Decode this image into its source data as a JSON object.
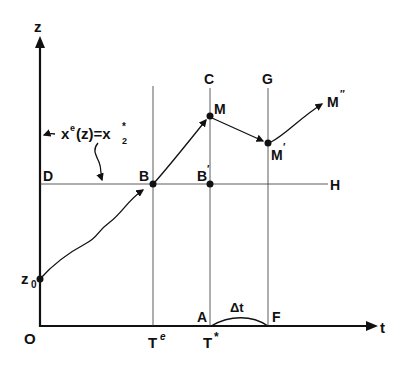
{
  "diagram": {
    "axes": {
      "y_label": "z",
      "x_label": "t",
      "origin_label": "O"
    },
    "points": {
      "C": "C",
      "G": "G",
      "M": "M",
      "M_prime": "M",
      "M_prime_mark": "′",
      "M_dprime": "M",
      "M_dprime_mark": "″",
      "D": "D",
      "B": "B",
      "B_prime": "B",
      "B_prime_mark": "′",
      "H": "H",
      "A": "A",
      "F": "F",
      "z0": "z",
      "z0_sub": "0"
    },
    "ticks": {
      "Te": "T",
      "Te_sup": "e",
      "Tstar": "T",
      "Tstar_sup": "*"
    },
    "annotations": {
      "equation_x": "x",
      "equation_sup": "e",
      "equation_mid": "(z)=x",
      "equation_sub": "2",
      "equation_star": "*",
      "delta_t": "Δt"
    },
    "colors": {
      "ink": "#111111",
      "background": "#ffffff"
    }
  }
}
